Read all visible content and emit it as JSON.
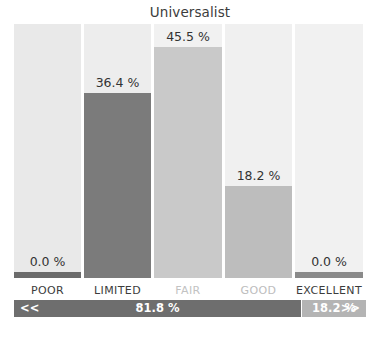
{
  "chart_data": {
    "type": "bar",
    "title": "Universalist",
    "xlabel": "",
    "ylabel": "",
    "ylim": [
      0,
      50
    ],
    "grid": false,
    "legend": "none",
    "categories": [
      "POOR",
      "LIMITED",
      "FAIR",
      "GOOD",
      "EXCELLENT"
    ],
    "values": [
      0.0,
      36.4,
      45.5,
      18.2,
      0.0
    ],
    "value_labels": [
      "0.0 %",
      "36.4 %",
      "45.5 %",
      "18.2 %",
      "0.0 %"
    ],
    "bar_colors": [
      "#6b6b6b",
      "#7b7b7b",
      "#c9c9c9",
      "#bdbdbd",
      "#8a8a8a"
    ],
    "background_colors": [
      "#e9e9e9",
      "#ededed",
      "#f1f1f1",
      "#f0f0f0",
      "#f1f1f1"
    ],
    "category_label_colors": [
      "#3c3c3c",
      "#3c3c3c",
      "#c2c2c2",
      "#bdbdbd",
      "#3c3c3c"
    ],
    "summary": {
      "segments": [
        {
          "label": "81.8 %",
          "value": 81.8,
          "arrow": "<<",
          "arrow_side": "left",
          "color": "#6e6e6e"
        },
        {
          "label": "18.2 %",
          "value": 18.2,
          "arrow": ">>",
          "arrow_side": "right",
          "color": "#b4b4b4"
        }
      ]
    }
  },
  "colors": {
    "title": "#3c3c3c",
    "value_text": "#333333",
    "page_background": "#ffffff"
  }
}
